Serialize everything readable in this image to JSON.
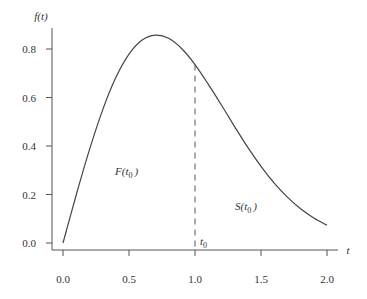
{
  "chart_data": {
    "type": "line",
    "title": "",
    "xlabel": "t",
    "ylabel": "f(t)",
    "xlim": [
      0.0,
      2.0
    ],
    "ylim": [
      0.0,
      0.88
    ],
    "grid": false,
    "legend": null,
    "x_ticks": [
      "0.0",
      "0.5",
      "1.0",
      "1.5",
      "2.0"
    ],
    "y_ticks": [
      "0.0",
      "0.2",
      "0.4",
      "0.6",
      "0.8"
    ],
    "series": [
      {
        "name": "f(t)",
        "style": "solid",
        "x": [
          0.0,
          0.1,
          0.2,
          0.3,
          0.4,
          0.5,
          0.6,
          0.7,
          0.8,
          0.9,
          1.0,
          1.1,
          1.2,
          1.3,
          1.4,
          1.5,
          1.6,
          1.7,
          1.8,
          1.9,
          2.0
        ],
        "y": [
          0.0,
          0.198,
          0.384,
          0.548,
          0.682,
          0.779,
          0.837,
          0.857,
          0.844,
          0.801,
          0.736,
          0.655,
          0.569,
          0.48,
          0.394,
          0.316,
          0.247,
          0.189,
          0.141,
          0.103,
          0.073
        ]
      }
    ],
    "annotations": [
      {
        "type": "vertical-dashed-line",
        "x": 1.0,
        "y_from": 0.0,
        "y_to": 0.736,
        "label": "t0"
      },
      {
        "type": "region-label",
        "text": "F(t0)",
        "x": 0.45,
        "y": 0.32
      },
      {
        "type": "region-label",
        "text": "S(t0)",
        "x": 1.42,
        "y": 0.11
      }
    ]
  },
  "labels": {
    "y_axis": {
      "main": "f(t)"
    },
    "x_axis": {
      "main": "t"
    },
    "t0": {
      "main": "t",
      "sub": "0"
    },
    "F": {
      "pre": "F(t",
      "sub": "0",
      "post": ")"
    },
    "S": {
      "pre": "S(t",
      "sub": "0",
      "post": ")"
    }
  },
  "ticks": {
    "x": [
      "0.0",
      "0.5",
      "1.0",
      "1.5",
      "2.0"
    ],
    "y": [
      "0.0",
      "0.2",
      "0.4",
      "0.6",
      "0.8"
    ]
  }
}
